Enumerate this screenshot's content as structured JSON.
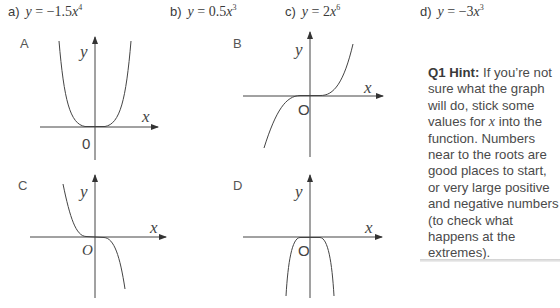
{
  "options": [
    {
      "label": "a)",
      "equation": {
        "lhs": "y",
        "eq": " = ",
        "coef": "−1.5",
        "var": "x",
        "exp": "4"
      }
    },
    {
      "label": "b)",
      "equation": {
        "lhs": "y",
        "eq": " = ",
        "coef": "0.5",
        "var": "x",
        "exp": "3"
      }
    },
    {
      "label": "c)",
      "equation": {
        "lhs": "y",
        "eq": " = ",
        "coef": "2",
        "var": "x",
        "exp": "6"
      }
    },
    {
      "label": "d)",
      "equation": {
        "lhs": "y",
        "eq": " = ",
        "coef": "−3",
        "var": "x",
        "exp": "3"
      }
    }
  ],
  "graphs": [
    {
      "label": "A",
      "x_axis_label": "x",
      "y_axis_label": "y",
      "origin_label": "0",
      "shape": "even-power-positive"
    },
    {
      "label": "B",
      "x_axis_label": "x",
      "y_axis_label": "y",
      "origin_label": "O",
      "shape": "odd-power-positive"
    },
    {
      "label": "C",
      "x_axis_label": "x",
      "y_axis_label": "y",
      "origin_label": "O",
      "shape": "odd-power-negative"
    },
    {
      "label": "D",
      "x_axis_label": "x",
      "y_axis_label": "y",
      "origin_label": "O",
      "shape": "even-power-negative"
    }
  ],
  "hint": {
    "title": "Q1 Hint:",
    "text_before_x": "If you’re not sure what the graph will do, stick some values for ",
    "variable": "x",
    "text_after_x": " into the function.  Numbers near to the roots are good places to start, or very large positive and negative numbers (to check what happens at the extremes)."
  }
}
